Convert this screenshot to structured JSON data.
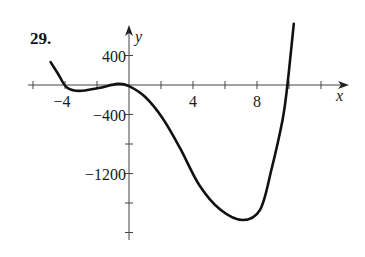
{
  "problem_number": "29.",
  "chart_data": {
    "type": "line",
    "title": "",
    "xlabel": "x",
    "ylabel": "y",
    "xlim": [
      -7.5,
      13.5
    ],
    "ylim": [
      -2100,
      700
    ],
    "x_ticks": [
      -6,
      -4,
      -2,
      0,
      2,
      4,
      6,
      8,
      10,
      12
    ],
    "x_tick_labels": [
      {
        "value": -4,
        "label": "−4"
      },
      {
        "value": 4,
        "label": "4"
      },
      {
        "value": 8,
        "label": "8"
      }
    ],
    "y_ticks": [
      400,
      0,
      -400,
      -800,
      -1200,
      -1600,
      -2000
    ],
    "y_tick_labels": [
      {
        "value": 400,
        "label": "400"
      },
      {
        "value": -400,
        "label": "−400"
      },
      {
        "value": -1200,
        "label": "−1200"
      }
    ],
    "grid": false,
    "legend": null,
    "series": [
      {
        "name": "f(x)",
        "x": [
          -4.9,
          -4.4,
          -3.9,
          -3.1,
          -1.9,
          -0.7,
          0.0,
          1.0,
          2.1,
          3.2,
          4.4,
          5.7,
          7.1,
          8.2,
          8.9,
          9.6,
          9.9,
          10.3
        ],
        "y": [
          310,
          140,
          -30,
          -80,
          -40,
          15,
          -15,
          -160,
          -450,
          -860,
          -1360,
          -1690,
          -1830,
          -1690,
          -1150,
          -470,
          0,
          830
        ]
      }
    ]
  }
}
